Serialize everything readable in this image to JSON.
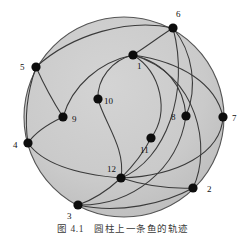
{
  "figure": {
    "caption": "图 4.1　圆柱上一条鱼的轨迹",
    "background_color": "#ffffff",
    "disk_fill_color": "#c9c9c9",
    "disk_stroke_color": "#555555",
    "edge_color": "#3a3a3a",
    "node_color": "#0d0d0d",
    "label_color": "#111111"
  },
  "chart_data": {
    "type": "diagram-graph",
    "title": "图 4.1　圆柱上一条鱼的轨迹",
    "shape": "disk",
    "disk": {
      "cx": 124,
      "cy": 117,
      "r": 100
    },
    "node_radius": 4.6,
    "nodes": [
      {
        "id": "1",
        "label": "1",
        "x": 133,
        "y": 55,
        "lx": 137,
        "ly": 69
      },
      {
        "id": "2",
        "label": "2",
        "x": 193,
        "y": 188,
        "lx": 207,
        "ly": 192
      },
      {
        "id": "3",
        "label": "3",
        "x": 78,
        "y": 205,
        "lx": 67,
        "ly": 219
      },
      {
        "id": "4",
        "label": "4",
        "x": 28,
        "y": 143,
        "lx": 13,
        "ly": 148
      },
      {
        "id": "5",
        "label": "5",
        "x": 36,
        "y": 67,
        "lx": 20,
        "ly": 70
      },
      {
        "id": "6",
        "label": "6",
        "x": 173,
        "y": 28,
        "lx": 176,
        "ly": 17
      },
      {
        "id": "7",
        "label": "7",
        "x": 223,
        "y": 117,
        "lx": 232,
        "ly": 121
      },
      {
        "id": "8",
        "label": "8",
        "x": 186,
        "y": 116,
        "lx": 171,
        "ly": 120
      },
      {
        "id": "9",
        "label": "9",
        "x": 63,
        "y": 117,
        "lx": 72,
        "ly": 122
      },
      {
        "id": "10",
        "label": "10",
        "x": 98,
        "y": 99,
        "lx": 104,
        "ly": 104
      },
      {
        "id": "11",
        "label": "11",
        "x": 151,
        "y": 138,
        "lx": 140,
        "ly": 153
      },
      {
        "id": "12",
        "label": "12",
        "x": 121,
        "y": 178,
        "lx": 107,
        "ly": 172
      }
    ],
    "edges": [
      {
        "from": "1",
        "to": "6",
        "path": "M133,55 C146,47 160,36 173,28"
      },
      {
        "from": "6",
        "to": "5",
        "path": "M173,28 C130,18 72,34 36,67"
      },
      {
        "from": "5",
        "to": "9",
        "path": "M36,67 C44,85 54,103 63,117"
      },
      {
        "from": "9",
        "to": "1",
        "path": "M63,117 C72,86 99,62 133,55"
      },
      {
        "from": "10",
        "to": "1",
        "path": "M98,99 C97,79 112,60 133,55"
      },
      {
        "from": "10",
        "to": "12",
        "path": "M98,99 C104,122 126,148 121,178"
      },
      {
        "from": "12",
        "to": "6",
        "path": "M121,178 C166,160 190,92 173,28"
      },
      {
        "from": "12",
        "to": "7",
        "path": "M121,178 C178,176 221,153 223,117"
      },
      {
        "from": "12",
        "to": "2",
        "path": "M121,178 C146,186 170,189 193,188"
      },
      {
        "from": "12",
        "to": "4",
        "path": "M121,178 C85,175 44,166 28,143"
      },
      {
        "from": "12",
        "to": "3",
        "path": "M121,178 C108,190 93,200 78,205"
      },
      {
        "from": "11",
        "to": "1",
        "path": "M151,138 C170,112 161,72 133,55"
      },
      {
        "from": "11",
        "to": "12",
        "path": "M151,138 C144,152 132,167 121,178"
      },
      {
        "from": "8",
        "to": "6",
        "path": "M186,116 C198,88 193,52 173,28"
      },
      {
        "from": "8",
        "to": "3",
        "path": "M186,116 C178,170 132,206 78,205"
      },
      {
        "from": "3",
        "to": "2",
        "path": "M78,205 C118,214 164,204 193,188"
      },
      {
        "from": "4",
        "to": "5",
        "path": "M28,143 C24,117 28,90 36,67"
      },
      {
        "from": "4",
        "to": "9",
        "path": "M28,143 C34,134 48,124 63,117"
      },
      {
        "from": "1",
        "to": "7",
        "path": "M133,55 C182,62 216,84 223,117"
      },
      {
        "from": "1",
        "to": "8",
        "path": "M133,55 C166,63 184,87 186,116"
      },
      {
        "from": "1",
        "to": "2",
        "path": "M133,55 C198,74 212,148 193,188"
      }
    ],
    "node_count": 12,
    "edge_count": 21
  }
}
